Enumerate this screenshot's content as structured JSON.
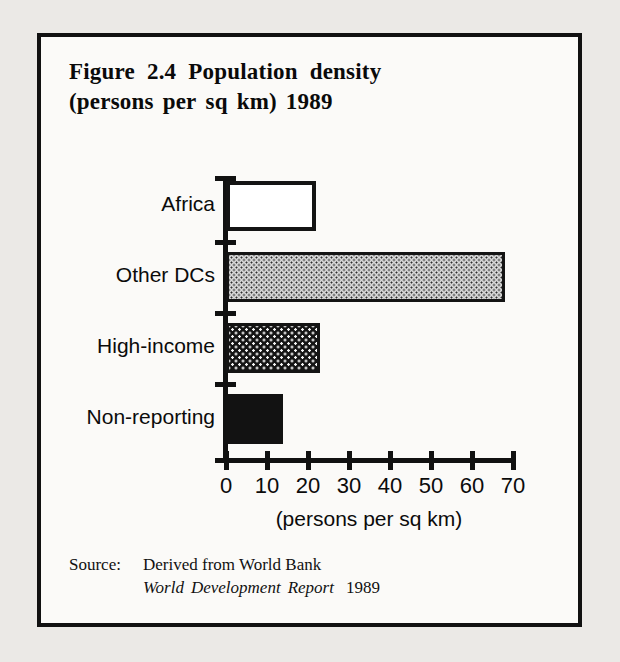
{
  "figure": {
    "title_line_1_words": [
      "Figure",
      "2.4",
      "Population",
      "density"
    ],
    "title_line_2_words": [
      "(persons",
      "per",
      "sq",
      "km)",
      "1989"
    ],
    "source_label": "Source:",
    "source_line_1": "Derived from World Bank",
    "source_publication_words": [
      "World",
      "Development",
      "Report"
    ],
    "source_year": "1989"
  },
  "chart_data": {
    "type": "bar",
    "orientation": "horizontal",
    "categories": [
      "Africa",
      "Other DCs",
      "High-income",
      "Non-reporting"
    ],
    "values": [
      22,
      68,
      23,
      14
    ],
    "fills": [
      "white-outline",
      "light-dotted",
      "dark-grid",
      "solid-black"
    ],
    "xlabel": "(persons per sq km)",
    "ylabel": "",
    "xlim": [
      0,
      70
    ],
    "xticks": [
      0,
      10,
      20,
      30,
      40,
      50,
      60,
      70
    ],
    "xtick_labels": [
      "0",
      "10",
      "20",
      "30",
      "40",
      "50",
      "60",
      "70"
    ],
    "grid": false,
    "legend": false
  },
  "colors": {
    "ink": "#111111",
    "panel_background": "#fbfaf8",
    "page_background": "#ebe9e6",
    "light_fill": "#d7d7d7",
    "dark_fill": "#141414"
  }
}
